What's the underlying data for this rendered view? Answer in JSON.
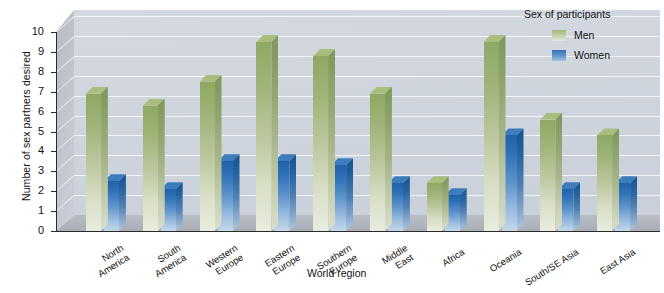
{
  "chart_data": {
    "type": "bar",
    "title": "",
    "xlabel": "World region",
    "ylabel": "Number of sex partners desired",
    "ylim": [
      0,
      10
    ],
    "ytick_step": 1,
    "yticks": [
      "0",
      "1",
      "2",
      "3",
      "4",
      "5",
      "6",
      "7",
      "8",
      "9",
      "10"
    ],
    "grid": true,
    "three_d": true,
    "legend_position": "top-right",
    "legend_title": "Sex of participants",
    "categories": [
      "North\nAmerica",
      "South\nAmerica",
      "Western\nEurope",
      "Eastern\nEurope",
      "Southern\nEurope",
      "Middle\nEast",
      "Africa",
      "Oceania",
      "South/SE Asia",
      "East Asia"
    ],
    "series": [
      {
        "name": "Men",
        "color": "#a3b878",
        "values": [
          6.9,
          6.3,
          7.5,
          9.5,
          8.8,
          6.9,
          2.4,
          9.5,
          5.6,
          4.8
        ]
      },
      {
        "name": "Women",
        "color": "#2f72b8",
        "values": [
          2.5,
          2.1,
          3.5,
          3.5,
          3.3,
          2.4,
          1.8,
          4.8,
          2.1,
          2.4
        ]
      }
    ]
  },
  "axes": {
    "y_title": "Number of sex partners desired",
    "x_title": "World region"
  },
  "legend": {
    "title": "Sex of participants",
    "items": [
      {
        "label": "Men",
        "color": "#a3b878"
      },
      {
        "label": "Women",
        "color": "#2f72b8"
      }
    ]
  }
}
